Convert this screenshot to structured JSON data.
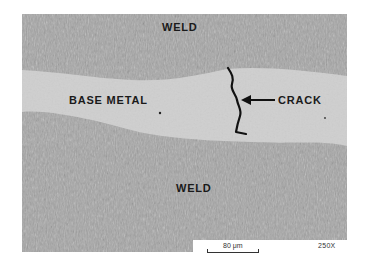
{
  "figure": {
    "type": "metallographic micrograph",
    "labels": {
      "weld_top": "WELD",
      "base_metal": "BASE METAL",
      "crack": "CRACK",
      "weld_bottom": "WELD"
    },
    "scale_bar": {
      "label": "80 μm"
    },
    "magnification": "250X",
    "colors": {
      "weld_texture": "#9c9c9c",
      "base_metal": "#cfcfcf",
      "crack": "#111111",
      "label_text": "#1a1a1a",
      "background": "#ffffff"
    }
  }
}
